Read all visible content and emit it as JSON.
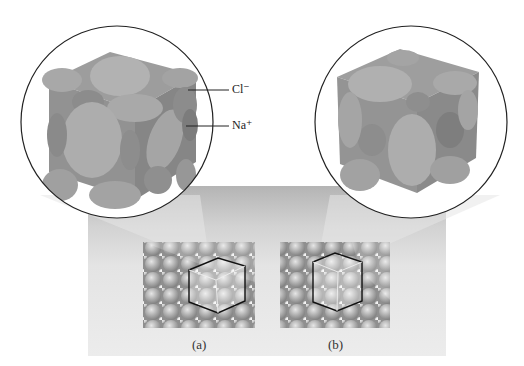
{
  "figure": {
    "labels": {
      "chloride": "Cl⁻",
      "sodium": "Na⁺"
    },
    "captions": {
      "a": "(a)",
      "b": "(b)"
    },
    "colors": {
      "background": "#ffffff",
      "panel": "#d8d8d8",
      "cube_face": "#9a9a9a",
      "sphere_light": "#a8a8a8",
      "sphere_dark": "#7f7f7f",
      "outline": "#222222"
    }
  }
}
